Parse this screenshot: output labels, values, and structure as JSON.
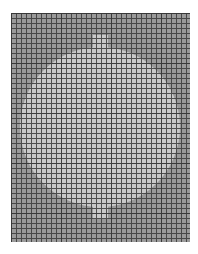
{
  "chart": {
    "title": "",
    "colors": {
      "background": "#9a9a9a",
      "motif": "#c9c9c9",
      "gridline": "#3a3a3a",
      "page": "#ffffff"
    },
    "grid": {
      "columns": 36,
      "rows": 46,
      "cell_px": 5
    },
    "motif": {
      "shape": "circle",
      "center": [
        89,
        114
      ],
      "radius": 80,
      "top_tab": {
        "x": 82,
        "y": 22,
        "w": 15,
        "h": 16
      },
      "bottom_tab": {
        "x": 82,
        "y": 195,
        "w": 15,
        "h": 15
      }
    }
  }
}
